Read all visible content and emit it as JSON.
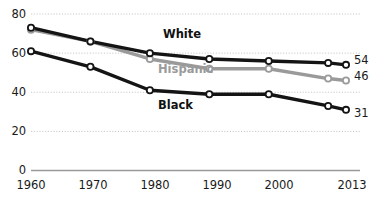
{
  "chart_data": {
    "type": "line",
    "title": "",
    "subtitle": "",
    "xlabel": "",
    "ylabel": "",
    "grid": true,
    "legend_position": "inline-labels",
    "x": [
      1960,
      1970,
      1980,
      1990,
      2000,
      2010,
      2013
    ],
    "xtick_labels": [
      "1960",
      "1970",
      "1980",
      "1990",
      "2000",
      "2013"
    ],
    "xtick_values": [
      1960,
      1970,
      1980,
      1990,
      2000,
      2013
    ],
    "ytick_labels": [
      "0",
      "20",
      "40",
      "60",
      "80"
    ],
    "ytick_values": [
      0,
      20,
      40,
      60,
      80
    ],
    "ylim": [
      0,
      80
    ],
    "xlim": [
      1960,
      2013
    ],
    "series": [
      {
        "name": "White",
        "color": "#141414",
        "values": [
          73,
          66,
          60,
          57,
          56,
          55,
          54
        ],
        "end_label": "54"
      },
      {
        "name": "Hispanic",
        "color": "#9a9a9a",
        "values": [
          72,
          66,
          57,
          52,
          52,
          47,
          46
        ],
        "end_label": "46"
      },
      {
        "name": "Black",
        "color": "#141414",
        "values": [
          61,
          53,
          41,
          39,
          39,
          33,
          31
        ],
        "end_label": "31"
      }
    ]
  },
  "labels": {
    "white": "White",
    "hispanic": "Hispanic",
    "black": "Black"
  },
  "end_labels": {
    "white": "54",
    "hispanic": "46",
    "black": "31"
  },
  "axis": {
    "y": [
      "80",
      "60",
      "40",
      "20",
      "0"
    ],
    "x": [
      "1960",
      "1970",
      "1980",
      "1990",
      "2000",
      "2013"
    ]
  },
  "colors": {
    "white_series": "#141414",
    "hispanic_series": "#9a9a9a",
    "black_series": "#141414",
    "gridline": "#c9c9c9",
    "axis": "#9a9a9a",
    "marker_fill": "#ffffff"
  }
}
